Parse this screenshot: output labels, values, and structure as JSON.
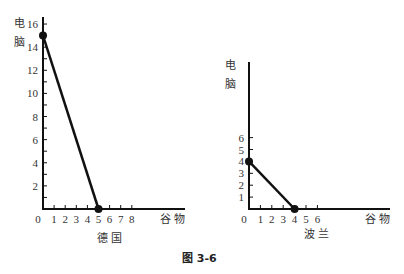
{
  "chart_data": [
    {
      "type": "line",
      "title": "德国",
      "xlabel": "谷物",
      "ylabel": "电脑",
      "x_ticks": [
        "0",
        "1",
        "2",
        "3",
        "4",
        "5",
        "6",
        "7",
        "8"
      ],
      "y_ticks": [
        "2",
        "4",
        "6",
        "8",
        "10",
        "12",
        "14",
        "16"
      ],
      "xlim": [
        0,
        8
      ],
      "ylim": [
        0,
        16
      ],
      "series": [
        {
          "name": "德国生产可能性边界",
          "points": [
            [
              0,
              15
            ],
            [
              5,
              0
            ]
          ]
        }
      ],
      "markers": [
        [
          0,
          15
        ],
        [
          5,
          0
        ]
      ],
      "grid": false
    },
    {
      "type": "line",
      "title": "波兰",
      "xlabel": "谷物",
      "ylabel": "电脑",
      "x_ticks": [
        "0",
        "1",
        "2",
        "3",
        "4",
        "5",
        "6"
      ],
      "y_ticks": [
        "1",
        "2",
        "3",
        "4",
        "5",
        "6"
      ],
      "xlim": [
        0,
        6
      ],
      "ylim": [
        0,
        6
      ],
      "series": [
        {
          "name": "波兰生产可能性边界",
          "points": [
            [
              0,
              4
            ],
            [
              4,
              0
            ]
          ]
        }
      ],
      "markers": [
        [
          0,
          4
        ],
        [
          4,
          0
        ]
      ],
      "grid": false
    }
  ],
  "labels": {
    "left_ylabel_1": "电",
    "left_ylabel_2": "脑",
    "left_xlabel": "谷  物",
    "left_title": "德  国",
    "right_ylabel_1": "电",
    "right_ylabel_2": "脑",
    "right_xlabel": "谷  物",
    "right_title": "波  兰",
    "caption": "图   3-6"
  }
}
